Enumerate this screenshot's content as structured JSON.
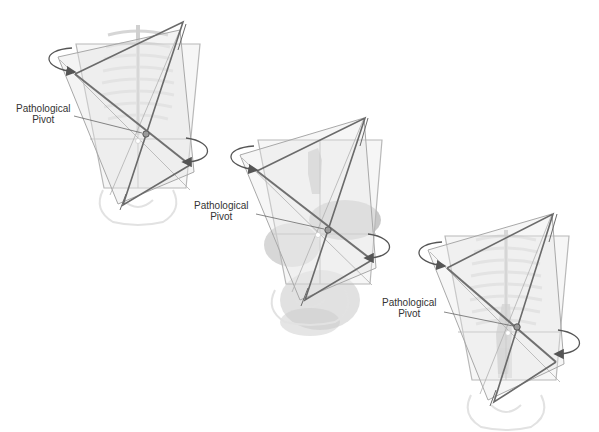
{
  "figures": [
    {
      "id": "figure-1",
      "label_line1": "Pathological",
      "label_line2": "Pivot",
      "anatomy": "ribcage"
    },
    {
      "id": "figure-2",
      "label_line1": "Pathological",
      "label_line2": "Pivot",
      "anatomy": "abdominal-organs"
    },
    {
      "id": "figure-3",
      "label_line1": "Pathological",
      "label_line2": "Pivot",
      "anatomy": "ribcage-spine"
    }
  ],
  "colors": {
    "plane_frame": "#b8b8b8",
    "plane_fill": "#ececec",
    "axis_line": "#6e6e6e",
    "rotation_arrow": "#555555",
    "anatomy": "#d8d8d8",
    "organ": "#a8a8a8",
    "label_text": "#333333"
  }
}
